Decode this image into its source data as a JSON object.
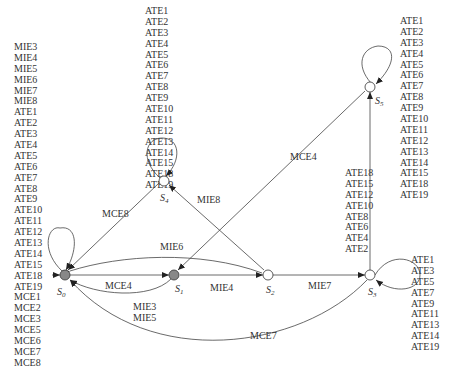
{
  "states": [
    {
      "id": "S0",
      "label": "S",
      "sub": "0",
      "fill": "#888888"
    },
    {
      "id": "S1",
      "label": "S",
      "sub": "1",
      "fill": "#888888"
    },
    {
      "id": "S2",
      "label": "S",
      "sub": "2",
      "fill": "#ffffff"
    },
    {
      "id": "S3",
      "label": "S",
      "sub": "3",
      "fill": "#ffffff"
    },
    {
      "id": "S4",
      "label": "S",
      "sub": "4",
      "fill": "#ffffff"
    },
    {
      "id": "S5",
      "label": "S",
      "sub": "5",
      "fill": "#ffffff"
    }
  ],
  "edges": [
    {
      "from": "S0",
      "to": "S1",
      "label": "MCE4"
    },
    {
      "from": "S1",
      "to": "S0",
      "label": "MIE3\nMIE5"
    },
    {
      "from": "S1",
      "to": "S2",
      "label": "MIE4"
    },
    {
      "from": "S2",
      "to": "S0",
      "label": "MIE6"
    },
    {
      "from": "S2",
      "to": "S3",
      "label": "MIE7"
    },
    {
      "from": "S2",
      "to": "S4",
      "label": "MIE8"
    },
    {
      "from": "S4",
      "to": "S0",
      "label": "MCE8"
    },
    {
      "from": "S5",
      "to": "S1",
      "label": "MCE4"
    },
    {
      "from": "S3",
      "to": "S0",
      "label": "MCE7"
    },
    {
      "from": "S3",
      "to": "S5",
      "label": "ATE18 ATE15 ATE12 ATE10 ATE8 ATE6 ATE4 ATE2"
    }
  ],
  "labels": {
    "mce4_top": "MCE4",
    "mie3": "MIE3",
    "mie5": "MIE5",
    "mie4": "MIE4",
    "mie6": "MIE6",
    "mie7": "MIE7",
    "mie8": "MIE8",
    "mce8": "MCE8",
    "mce4_diag": "MCE4",
    "mce7": "MCE7"
  },
  "self_loops": {
    "S0": [
      "MIE3",
      "MIE4",
      "MIE5",
      "MIE6",
      "MIE7",
      "MIE8",
      "ATE1",
      "ATE2",
      "ATE3",
      "ATE4",
      "ATE5",
      "ATE6",
      "ATE7",
      "ATE8",
      "ATE9",
      "ATE10",
      "ATE11",
      "ATE12",
      "ATE13",
      "ATE14",
      "ATE15",
      "ATE18",
      "ATE19",
      "MCE1",
      "MCE2",
      "MCE3",
      "MCE5",
      "MCE6",
      "MCE7",
      "MCE8"
    ],
    "S4": [
      "ATE1",
      "ATE2",
      "ATE3",
      "ATE4",
      "ATE5",
      "ATE6",
      "ATE7",
      "ATE8",
      "ATE9",
      "ATE10",
      "ATE11",
      "ATE12",
      "ATE13",
      "ATE14",
      "ATE15",
      "ATE18",
      "ATE19"
    ],
    "S5": [
      "ATE1",
      "ATE2",
      "ATE3",
      "ATE4",
      "ATE5",
      "ATE6",
      "ATE7",
      "ATE8",
      "ATE9",
      "ATE10",
      "ATE11",
      "ATE12",
      "ATE13",
      "ATE14",
      "ATE15",
      "ATE18",
      "ATE19"
    ],
    "S3": [
      "ATE1",
      "ATE3",
      "ATE5",
      "ATE7",
      "ATE9",
      "ATE11",
      "ATE13",
      "ATE14",
      "ATE19"
    ]
  },
  "s3_to_s5_labels": [
    "ATE18",
    "ATE15",
    "ATE12",
    "ATE10",
    "ATE8",
    "ATE6",
    "ATE4",
    "ATE2"
  ]
}
